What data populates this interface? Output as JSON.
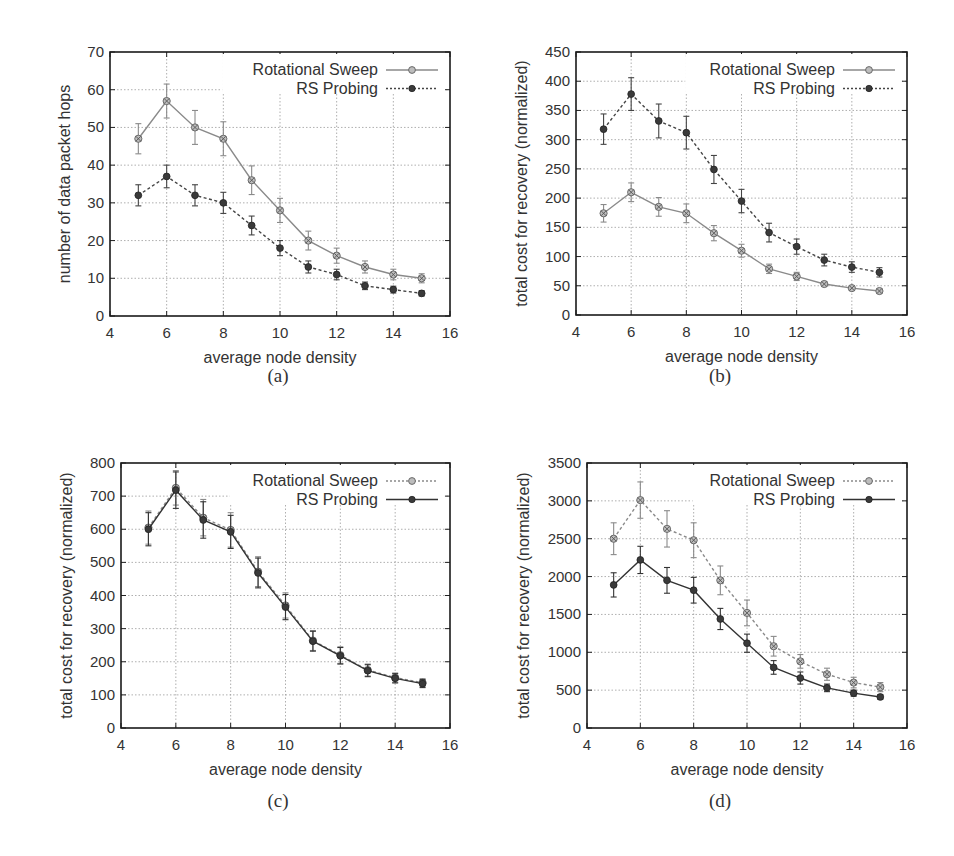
{
  "figure": {
    "panels": [
      "a",
      "b",
      "c",
      "d"
    ]
  },
  "chart_data": [
    {
      "id": "a",
      "type": "line",
      "caption": "(a)",
      "title": "",
      "xlabel": "average node density",
      "ylabel": "number of data packet hops",
      "xlim": [
        4,
        16
      ],
      "ylim": [
        0,
        70
      ],
      "xticks": [
        4,
        6,
        8,
        10,
        12,
        14,
        16
      ],
      "yticks": [
        0,
        10,
        20,
        30,
        40,
        50,
        60,
        70
      ],
      "grid": true,
      "legend_position": "upper right",
      "frame": {
        "left": 110,
        "top": 52,
        "right": 450,
        "bottom": 316
      },
      "x": [
        5,
        6,
        7,
        8,
        9,
        10,
        11,
        12,
        13,
        14,
        15
      ],
      "series": [
        {
          "name": "Rotational Sweep",
          "line": "solid",
          "marker": "circle-x",
          "color": "#8a8a8a",
          "values": [
            47,
            57,
            50,
            47,
            36,
            28,
            20,
            16,
            13,
            11,
            10
          ],
          "errors": [
            4,
            4.5,
            4.5,
            4.5,
            3.8,
            3.2,
            2.5,
            2,
            1.6,
            1.4,
            1.2
          ]
        },
        {
          "name": "RS Probing",
          "line": "dashed",
          "marker": "dot",
          "color": "#444444",
          "values": [
            32,
            37,
            32,
            30,
            24,
            18,
            13,
            11,
            8,
            7,
            6
          ],
          "errors": [
            2.8,
            3,
            2.8,
            2.8,
            2.5,
            2,
            1.6,
            1.4,
            1,
            0.9,
            0.7
          ]
        }
      ]
    },
    {
      "id": "b",
      "type": "line",
      "caption": "(b)",
      "title": "",
      "xlabel": "average node density",
      "ylabel": "total cost for recovery (normalized)",
      "xlim": [
        4,
        16
      ],
      "ylim": [
        0,
        450
      ],
      "xticks": [
        4,
        6,
        8,
        10,
        12,
        14,
        16
      ],
      "yticks": [
        0,
        50,
        100,
        150,
        200,
        250,
        300,
        350,
        400,
        450
      ],
      "grid": true,
      "legend_position": "upper right",
      "frame": {
        "left": 576,
        "top": 52,
        "right": 907,
        "bottom": 315
      },
      "x": [
        5,
        6,
        7,
        8,
        9,
        10,
        11,
        12,
        13,
        14,
        15
      ],
      "series": [
        {
          "name": "Rotational Sweep",
          "line": "solid",
          "marker": "circle-x",
          "color": "#8a8a8a",
          "values": [
            174,
            210,
            185,
            174,
            140,
            110,
            79,
            66,
            53,
            46,
            41
          ],
          "errors": [
            15,
            16,
            16,
            16,
            13,
            11,
            8,
            7,
            4,
            3,
            3
          ]
        },
        {
          "name": "RS Probing",
          "line": "dashed",
          "marker": "dot",
          "color": "#444444",
          "values": [
            318,
            378,
            332,
            312,
            249,
            195,
            141,
            117,
            94,
            82,
            73
          ],
          "errors": [
            26,
            28,
            29,
            28,
            24,
            20,
            16,
            13,
            10,
            9,
            8
          ]
        }
      ]
    },
    {
      "id": "c",
      "type": "line",
      "caption": "(c)",
      "title": "",
      "xlabel": "average node density",
      "ylabel": "total cost for recovery (normalized)",
      "xlim": [
        4,
        16
      ],
      "ylim": [
        0,
        800
      ],
      "xticks": [
        4,
        6,
        8,
        10,
        12,
        14,
        16
      ],
      "yticks": [
        0,
        100,
        200,
        300,
        400,
        500,
        600,
        700,
        800
      ],
      "grid": true,
      "legend_position": "upper right",
      "frame": {
        "left": 121,
        "top": 463,
        "right": 450,
        "bottom": 728
      },
      "x": [
        5,
        6,
        7,
        8,
        9,
        10,
        11,
        12,
        13,
        14,
        15
      ],
      "series": [
        {
          "name": "Rotational Sweep",
          "line": "dashed",
          "marker": "circle-x",
          "color": "#8a8a8a",
          "values": [
            605,
            725,
            635,
            598,
            472,
            370,
            264,
            220,
            175,
            152,
            137
          ],
          "errors": [
            50,
            52,
            55,
            52,
            45,
            38,
            30,
            25,
            18,
            14,
            12
          ]
        },
        {
          "name": "RS Probing",
          "line": "solid",
          "marker": "dot",
          "color": "#333333",
          "values": [
            600,
            718,
            628,
            592,
            468,
            365,
            262,
            218,
            173,
            150,
            134
          ],
          "errors": [
            50,
            55,
            55,
            50,
            45,
            38,
            30,
            25,
            18,
            14,
            12
          ]
        }
      ]
    },
    {
      "id": "d",
      "type": "line",
      "caption": "(d)",
      "title": "",
      "xlabel": "average node density",
      "ylabel": "total cost for recovery (normalized)",
      "xlim": [
        4,
        16
      ],
      "ylim": [
        0,
        3500
      ],
      "xticks": [
        4,
        6,
        8,
        10,
        12,
        14,
        16
      ],
      "yticks": [
        0,
        500,
        1000,
        1500,
        2000,
        2500,
        3000,
        3500
      ],
      "grid": true,
      "legend_position": "upper right",
      "frame": {
        "left": 587,
        "top": 463,
        "right": 907,
        "bottom": 728
      },
      "x": [
        5,
        6,
        7,
        8,
        9,
        10,
        11,
        12,
        13,
        14,
        15
      ],
      "series": [
        {
          "name": "Rotational Sweep",
          "line": "dashed",
          "marker": "circle-x",
          "color": "#8a8a8a",
          "values": [
            2500,
            3010,
            2630,
            2480,
            1950,
            1520,
            1080,
            880,
            710,
            600,
            540
          ],
          "errors": [
            210,
            240,
            240,
            230,
            190,
            170,
            130,
            90,
            80,
            70,
            60
          ]
        },
        {
          "name": "RS Probing",
          "line": "solid",
          "marker": "dot",
          "color": "#333333",
          "values": [
            1890,
            2220,
            1950,
            1820,
            1440,
            1120,
            800,
            660,
            530,
            460,
            410
          ],
          "errors": [
            160,
            180,
            170,
            170,
            140,
            120,
            90,
            80,
            50,
            40,
            30
          ]
        }
      ]
    }
  ]
}
